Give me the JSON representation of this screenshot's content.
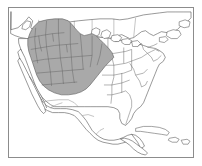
{
  "figure": {
    "kind": "range-map",
    "canvas": {
      "width": 202,
      "height": 166
    },
    "frame": {
      "visible": true,
      "border_color": "#8c8c8c",
      "background_color": "#ffffff"
    }
  },
  "legend": {
    "visible": false,
    "entries": [
      {
        "label": "Range",
        "swatch_color": "#a9a9a9"
      }
    ]
  },
  "labels": {
    "visible": false,
    "items": []
  },
  "style": {
    "range_fill_color": "#a9a9a9",
    "range_outline_color": "#5a5a5a",
    "coastline_color": "#444444",
    "state_border_color": "#555555",
    "land_fill_color": "#ffffff",
    "ocean_color": "#ffffff"
  },
  "map_layers": [
    {
      "name": "ocean-background",
      "type": "background",
      "fill": "#ffffff"
    },
    {
      "name": "canada-outline",
      "type": "coastline",
      "region": "Canada"
    },
    {
      "name": "united-states-outline",
      "type": "coastline",
      "region": "United States"
    },
    {
      "name": "mexico-outline",
      "type": "coastline",
      "region": "Mexico"
    },
    {
      "name": "central-america-outline",
      "type": "coastline",
      "region": "Central America"
    },
    {
      "name": "caribbean-islands",
      "type": "coastline",
      "region": "Cuba and Caribbean"
    },
    {
      "name": "great-lakes",
      "type": "waterbody",
      "region": "Great Lakes"
    },
    {
      "name": "state-boundaries",
      "type": "admin-boundary",
      "region": "United States states"
    },
    {
      "name": "province-boundaries",
      "type": "admin-boundary",
      "region": "Canadian provinces"
    },
    {
      "name": "species-range",
      "type": "range-polygon",
      "fill": "#a9a9a9"
    }
  ],
  "range": {
    "name": "species-range-polygon",
    "fill_color": "#a9a9a9",
    "outline_color": "#5a5a5a",
    "coverage_note": "Western and central United States, extending marginally into southern Canada and northern Mexico",
    "regions_covered": [
      "Washington",
      "Oregon",
      "Idaho",
      "Montana",
      "Wyoming",
      "North Dakota",
      "South Dakota",
      "Nebraska",
      "Kansas",
      "Colorado",
      "Utah",
      "Nevada",
      "California (eastern)",
      "Arizona",
      "New Mexico",
      "Oklahoma (western)",
      "Texas (northwestern)",
      "Minnesota (western)",
      "Iowa (western)",
      "Missouri (western)"
    ]
  }
}
